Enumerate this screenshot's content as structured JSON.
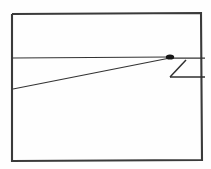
{
  "figure": {
    "canvas": {
      "width": 211,
      "height": 169
    },
    "colors": {
      "background": "#fefefe",
      "frame_stroke": "#3a3a3a",
      "line_stroke": "#333333",
      "marker_fill": "#161616"
    },
    "shapes": [
      {
        "name": "outer-rectangle",
        "type": "polyline",
        "points": "12,14 201,13 202,160 12,161 12,14"
      },
      {
        "name": "horizontal-divider",
        "type": "line",
        "points": "12,58 170,57"
      },
      {
        "name": "diagonal-ray",
        "type": "line",
        "points": "13,89 170,58"
      },
      {
        "name": "right-upper-stub",
        "type": "line",
        "points": "172,58 205,58"
      },
      {
        "name": "notch-diagonal",
        "type": "line",
        "points": "186,60 170,77"
      },
      {
        "name": "notch-base",
        "type": "line",
        "points": "170,77 205,77"
      }
    ],
    "markers": [
      {
        "name": "vertex-marker",
        "type": "blob",
        "cx": 170,
        "cy": 57,
        "rx": 4.2,
        "ry": 2.6
      }
    ]
  }
}
